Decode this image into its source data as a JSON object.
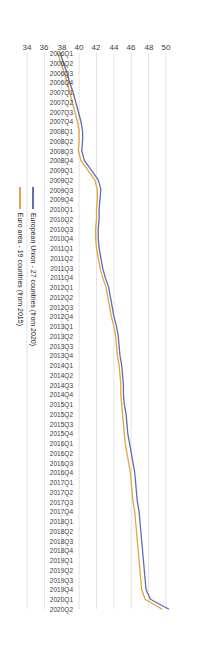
{
  "chart_data": {
    "type": "line",
    "title": "",
    "xlabel": "",
    "ylabel": "",
    "orientation": "rotated-180",
    "grid": true,
    "legend_position": "right",
    "ylim": [
      34,
      50
    ],
    "yticks": [
      50,
      48,
      46,
      44,
      42,
      40,
      38,
      36,
      34
    ],
    "categories": [
      "2006Q1",
      "2006Q2",
      "2006Q3",
      "2006Q4",
      "2007Q1",
      "2007Q2",
      "2007Q3",
      "2007Q4",
      "2008Q1",
      "2008Q2",
      "2008Q3",
      "2008Q4",
      "2009Q1",
      "2009Q2",
      "2009Q3",
      "2009Q4",
      "2010Q1",
      "2010Q2",
      "2010Q3",
      "2010Q4",
      "2011Q1",
      "2011Q2",
      "2011Q3",
      "2011Q4",
      "2012Q1",
      "2012Q2",
      "2012Q3",
      "2012Q4",
      "2013Q1",
      "2013Q2",
      "2013Q3",
      "2013Q4",
      "2014Q1",
      "2014Q2",
      "2014Q3",
      "2014Q4",
      "2015Q1",
      "2015Q2",
      "2015Q3",
      "2015Q4",
      "2016Q1",
      "2016Q2",
      "2016Q3",
      "2016Q4",
      "2017Q1",
      "2017Q2",
      "2017Q3",
      "2017Q4",
      "2018Q1",
      "2018Q2",
      "2018Q3",
      "2018Q4",
      "2019Q1",
      "2019Q2",
      "2019Q3",
      "2019Q4",
      "2020Q1",
      "2020Q2"
    ],
    "series": [
      {
        "name": "European Union - 27 countries (from 2020)",
        "color": "#5B6FB8",
        "values": [
          37.8,
          38.2,
          38.6,
          38.9,
          39.3,
          39.6,
          39.9,
          40.2,
          40.4,
          40.4,
          40.3,
          40.6,
          41.4,
          42.2,
          42.5,
          42.4,
          42.3,
          42.3,
          42.2,
          42.2,
          42.3,
          42.5,
          42.7,
          43.0,
          43.4,
          43.6,
          43.8,
          44.0,
          44.3,
          44.5,
          44.6,
          44.7,
          44.9,
          45.0,
          45.1,
          45.1,
          45.2,
          45.4,
          45.5,
          45.6,
          45.8,
          46.0,
          46.2,
          46.4,
          46.5,
          46.6,
          46.7,
          46.9,
          47.0,
          47.1,
          47.2,
          47.3,
          47.4,
          47.5,
          47.6,
          47.7,
          48.2,
          50.3
        ]
      },
      {
        "name": "Euro area - 19 countries (from 2015)",
        "color": "#E8A33D",
        "values": [
          37.5,
          37.9,
          38.3,
          38.6,
          38.9,
          39.2,
          39.5,
          39.8,
          40.0,
          40.0,
          39.9,
          40.2,
          41.0,
          41.8,
          42.1,
          42.1,
          42.0,
          42.0,
          41.9,
          41.9,
          42.0,
          42.2,
          42.4,
          42.7,
          43.1,
          43.3,
          43.5,
          43.7,
          44.0,
          44.2,
          44.3,
          44.4,
          44.6,
          44.7,
          44.8,
          44.8,
          44.9,
          45.0,
          45.1,
          45.2,
          45.3,
          45.5,
          45.7,
          45.9,
          46.0,
          46.1,
          46.2,
          46.4,
          46.5,
          46.6,
          46.7,
          46.8,
          46.9,
          47.0,
          47.1,
          47.2,
          47.6,
          49.5
        ]
      }
    ]
  },
  "legend": {
    "items": [
      {
        "label": "European Union - 27 countries (from 2020)",
        "color": "#5B6FB8"
      },
      {
        "label": "Euro area - 19 countries (from 2015)",
        "color": "#E8A33D"
      }
    ]
  }
}
